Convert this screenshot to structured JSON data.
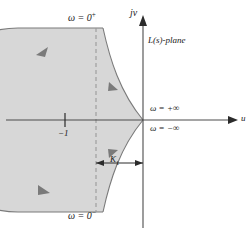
{
  "figure": {
    "name": "nyquist-contour-plot",
    "plane_label": "L(s)-plane",
    "axes": {
      "vertical_label": "jv",
      "vertical_label_j": "j",
      "vertical_label_v": "v",
      "horizontal_label": "u"
    },
    "labels": {
      "omega_zero_plus": "ω = 0",
      "omega_zero_plus_exp": "+",
      "omega_zero_minus": "ω = 0",
      "omega_zero_minus_exp": "−",
      "omega_plus_infinity": "ω = +∞",
      "omega_minus_infinity": "ω = −∞",
      "minus_one": "−1",
      "gain_margin": "K",
      "gain_margin_sub": "1"
    },
    "colors": {
      "region_fill": "#d7d7d7",
      "region_stroke": "#7a7a7a",
      "axis": "#4c4c4c",
      "dashed_guide": "#9a9a9a",
      "text": "#1a1a1a",
      "background": "#ffffff"
    },
    "geometry": {
      "origin_x": 143,
      "origin_y": 120,
      "minus_one_x": 65,
      "dashed_line_x": 96,
      "k1_span_left": 96,
      "k1_span_right": 143
    },
    "arrow_markers": [
      {
        "name": "arrow-upper-arc",
        "x": 43,
        "y": 52
      },
      {
        "name": "arrow-upper-inner",
        "x": 114,
        "y": 87
      },
      {
        "name": "arrow-lower-inner",
        "x": 114,
        "y": 152
      },
      {
        "name": "arrow-lower-arc",
        "x": 45,
        "y": 190
      }
    ]
  }
}
